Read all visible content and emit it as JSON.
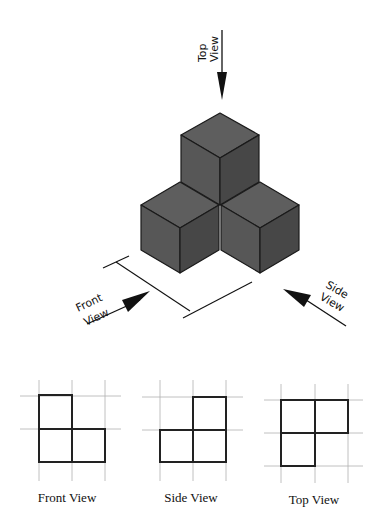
{
  "diagram": {
    "type": "isometric-orthographic-projection",
    "arrows": {
      "top": {
        "line1": "Top",
        "line2": "View"
      },
      "front": {
        "line1": "Front",
        "line2": "View"
      },
      "side": {
        "line1": "Side",
        "line2": "View"
      }
    },
    "colors": {
      "top_face": "#5e5e5e",
      "left_face": "#555555",
      "right_face": "#464646",
      "edge": "#1a1a1a",
      "grid": "#b0b0b0",
      "outline": "#222222"
    },
    "views": [
      {
        "caption": "Front View",
        "cells": [
          [
            0,
            0
          ],
          [
            0,
            1
          ],
          [
            1,
            1
          ]
        ]
      },
      {
        "caption": "Side View",
        "cells": [
          [
            1,
            0
          ],
          [
            0,
            1
          ],
          [
            1,
            1
          ]
        ]
      },
      {
        "caption": "Top View",
        "cells": [
          [
            0,
            0
          ],
          [
            1,
            0
          ],
          [
            0,
            1
          ]
        ]
      }
    ]
  }
}
